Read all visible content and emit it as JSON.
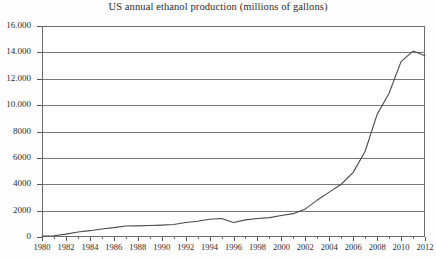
{
  "chart_data": {
    "type": "line",
    "title": "US annual ethanol production (millions of gallons)",
    "xlabel": "",
    "ylabel": "",
    "xlim": [
      1980,
      2012
    ],
    "ylim": [
      0,
      16000
    ],
    "grid": true,
    "legend": "none",
    "ytick_labels": [
      "16.000",
      "14.000",
      "12.000",
      "10.000",
      "8000",
      "6000",
      "4000",
      "2000",
      "0"
    ],
    "ytick_values": [
      16000,
      14000,
      12000,
      10000,
      8000,
      6000,
      4000,
      2000,
      0
    ],
    "xtick_labels": [
      "1980",
      "1982",
      "1984",
      "1986",
      "1988",
      "1990",
      "1992",
      "1994",
      "1996",
      "1998",
      "2000",
      "2002",
      "2004",
      "2006",
      "2008",
      "2010",
      "2012"
    ],
    "xtick_values": [
      1980,
      1982,
      1984,
      1986,
      1988,
      1990,
      1992,
      1994,
      1996,
      1998,
      2000,
      2002,
      2004,
      2006,
      2008,
      2010,
      2012
    ],
    "xtick_minor_values": [
      1981,
      1983,
      1985,
      1987,
      1989,
      1991,
      1993,
      1995,
      1997,
      1999,
      2001,
      2003,
      2005,
      2007,
      2009,
      2011
    ],
    "series": [
      {
        "name": "US annual ethanol production",
        "x": [
          1980,
          1981,
          1982,
          1983,
          1984,
          1985,
          1986,
          1987,
          1988,
          1989,
          1990,
          1991,
          1992,
          1993,
          1994,
          1995,
          1996,
          1997,
          1998,
          1999,
          2000,
          2001,
          2002,
          2003,
          2004,
          2005,
          2006,
          2007,
          2008,
          2009,
          2010,
          2011,
          2012
        ],
        "values": [
          80,
          90,
          220,
          380,
          480,
          610,
          710,
          830,
          845,
          870,
          900,
          950,
          1100,
          1200,
          1350,
          1400,
          1100,
          1300,
          1400,
          1470,
          1630,
          1770,
          2130,
          2800,
          3400,
          4000,
          4900,
          6500,
          9300,
          10900,
          13300,
          14100,
          13750
        ]
      }
    ],
    "colors": {
      "line": "#4a4a4a",
      "grid": "#777777",
      "frame": "#6b6b6b",
      "text": "#2b2b2b",
      "background": "#ffffff"
    }
  }
}
